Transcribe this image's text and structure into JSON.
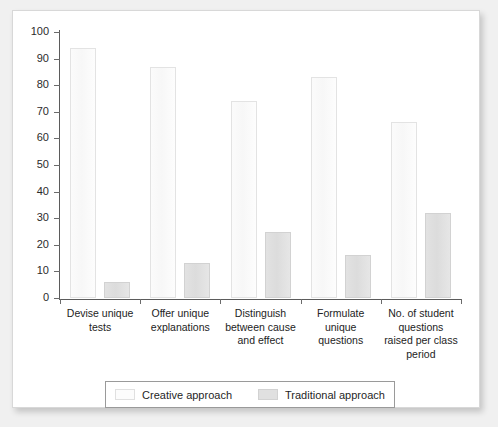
{
  "chart_data": {
    "type": "bar",
    "title": "",
    "xlabel": "",
    "ylabel": "",
    "ylim": [
      0,
      100
    ],
    "ytick_step": 10,
    "ytick_labels": [
      "100",
      "90",
      "80",
      "70",
      "60",
      "50",
      "40",
      "30",
      "20",
      "10",
      "0"
    ],
    "ytick_values": [
      100,
      90,
      80,
      70,
      60,
      50,
      40,
      30,
      20,
      10,
      0
    ],
    "grid": false,
    "legend_position": "bottom",
    "categories": [
      "Devise unique tests",
      "Offer unique explanations",
      "Distinguish between cause and effect",
      "Formulate unique questions",
      "No. of student questions raised per class period"
    ],
    "category_lines": [
      [
        "Devise unique",
        "tests"
      ],
      [
        "Offer unique",
        "explanations"
      ],
      [
        "Distinguish",
        "between cause",
        "and effect"
      ],
      [
        "Formulate",
        "unique",
        "questions"
      ],
      [
        "No. of student",
        "questions",
        "raised per class",
        "period"
      ]
    ],
    "series": [
      {
        "name": "Creative approach",
        "color": "#fbfbfb",
        "values": [
          94,
          87,
          74,
          83,
          66
        ]
      },
      {
        "name": "Traditional approach",
        "color": "#e0e0e0",
        "values": [
          6,
          13,
          25,
          16,
          32
        ]
      }
    ]
  },
  "legend": {
    "items": [
      {
        "label": "Creative approach",
        "swatch": "creative"
      },
      {
        "label": "Traditional approach",
        "swatch": "traditional"
      }
    ]
  }
}
